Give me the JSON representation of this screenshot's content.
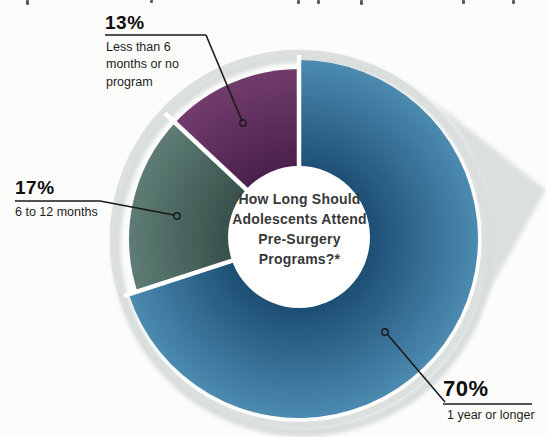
{
  "chart_data": {
    "type": "pie",
    "subtype": "donut",
    "title": "How Long Should Adolescents Attend Pre-Surgery Programs?*",
    "title_lines": [
      "How Long Should",
      "Adolescents Attend",
      "Pre-Surgery",
      "Programs?*"
    ],
    "start_angle_deg": 0,
    "direction": "clockwise",
    "legend_position": "callout-labels",
    "slices": [
      {
        "label": "1 year or longer",
        "pct_label": "70%",
        "value": 70,
        "color_inner": "#1e4f75",
        "color_outer": "#4c8ab0"
      },
      {
        "label": "6 to 12 months",
        "pct_label": "17%",
        "value": 17,
        "color_inner": "#374f4a",
        "color_outer": "#5e7c75"
      },
      {
        "label": "Less than 6 months or no program",
        "pct_label": "13%",
        "value": 13,
        "color_inner": "#491f4a",
        "color_outer": "#713c6c"
      }
    ],
    "colors": {
      "ring_shadow": "#d8dcdc",
      "outer_ring": "#dadedd",
      "wedge_shadow": "#dcdfe0",
      "hole": "#ffffff",
      "leader_line": "#1a1a1a"
    }
  },
  "labels": {
    "slice_13": {
      "pct": "13%",
      "text": "Less than 6 months or no program"
    },
    "slice_17": {
      "pct": "17%",
      "text": "6 to 12 months"
    },
    "slice_70": {
      "pct": "70%",
      "text": "1 year or longer"
    }
  },
  "center": {
    "line1": "How Long Should",
    "line2": "Adolescents Attend",
    "line3": "Pre-Surgery",
    "line4": "Programs?*"
  }
}
